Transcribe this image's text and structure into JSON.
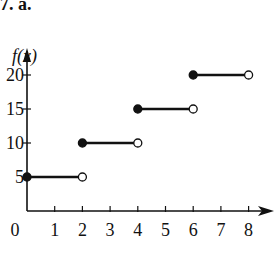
{
  "header": {
    "label": "7. a."
  },
  "chart_data": {
    "type": "line",
    "subtype": "step-function",
    "title": "",
    "xlabel": "",
    "ylabel": "f(x)",
    "xlim": [
      0,
      8
    ],
    "ylim": [
      0,
      20
    ],
    "x_ticks": [
      "0",
      "1",
      "2",
      "3",
      "4",
      "5",
      "6",
      "7",
      "8"
    ],
    "y_ticks": [
      "5",
      "10",
      "15",
      "20"
    ],
    "grid": false,
    "legend": null,
    "segments": [
      {
        "x_start": 0,
        "x_end": 2,
        "y": 5,
        "start_closed": true,
        "end_closed": false
      },
      {
        "x_start": 2,
        "x_end": 4,
        "y": 10,
        "start_closed": true,
        "end_closed": false
      },
      {
        "x_start": 4,
        "x_end": 6,
        "y": 15,
        "start_closed": true,
        "end_closed": false
      },
      {
        "x_start": 6,
        "x_end": 8,
        "y": 20,
        "start_closed": true,
        "end_closed": false
      }
    ]
  },
  "colors": {
    "ink": "#111111",
    "background": "#ffffff"
  }
}
